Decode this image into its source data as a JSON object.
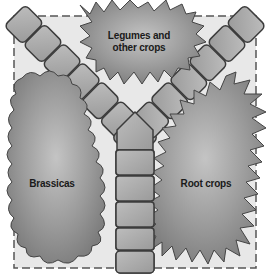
{
  "diagram": {
    "beds": [
      {
        "id": "legumes",
        "label": "Legumes and other crops",
        "line1": "Legumes and",
        "line2": "other crops",
        "position": "top-center"
      },
      {
        "id": "brassicas",
        "label": "Brassicas",
        "position": "bottom-left"
      },
      {
        "id": "roots",
        "label": "Root crops",
        "position": "bottom-right"
      }
    ],
    "path": {
      "shape": "Y-shaped paving-stone path",
      "left_arm_stones": 7,
      "right_arm_stones": 6,
      "stem_stones": 5
    },
    "colors": {
      "foliage": "#8a8a8a",
      "foliage_light": "#b4b4b4",
      "stone": "#a8a8a8",
      "stone_outline": "#3c3c3c",
      "ground": "#e6e6e6",
      "border": "#555555",
      "text": "#1a1a1a"
    }
  }
}
